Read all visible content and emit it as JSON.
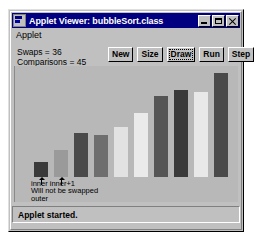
{
  "window": {
    "title": "Applet Viewer: bubbleSort.class",
    "icon": "applet-viewer-icon",
    "controls": {
      "minimize": "minimize-icon",
      "maximize": "maximize-icon",
      "close": "close-icon"
    }
  },
  "menubar": {
    "items": [
      "Applet"
    ]
  },
  "stats": {
    "swaps_label": "Swaps = 36",
    "comparisons_label": "Comparisons = 45",
    "swaps": 36,
    "comparisons": 45
  },
  "toolbar": {
    "buttons": [
      {
        "label": "New",
        "focused": false
      },
      {
        "label": "Size",
        "focused": false
      },
      {
        "label": "Draw",
        "focused": true
      },
      {
        "label": "Run",
        "focused": false
      },
      {
        "label": "Step",
        "focused": false
      }
    ]
  },
  "annotation": {
    "pointer_labels": "inner inner+1",
    "line2": "Will not be swapped",
    "line3": "outer",
    "markers": [
      {
        "name": "inner-marker",
        "index": 0
      },
      {
        "name": "inner-plus-one-marker",
        "index": 1
      }
    ]
  },
  "statusbar": {
    "text": "Applet started."
  },
  "colors": {
    "titlebar": "#000080",
    "face": "#c0c0c0",
    "panel": "#b8b8b8",
    "bar_dark": "#3a3a3a",
    "bar_medium": "#9a9a9a",
    "bar_light": "#e2e2e2"
  },
  "chart_data": {
    "type": "bar",
    "title": "",
    "xlabel": "",
    "ylabel": "",
    "grid": false,
    "legend": null,
    "ylim": [
      0,
      100
    ],
    "categories": [
      "0",
      "1",
      "2",
      "3",
      "4",
      "5",
      "6",
      "7",
      "8",
      "9"
    ],
    "values": [
      14,
      26,
      42,
      40,
      48,
      62,
      78,
      84,
      82,
      100
    ],
    "bar_colors": [
      "#3a3a3a",
      "#9a9a9a",
      "#4a4a4a",
      "#6e6e6e",
      "#e2e2e2",
      "#eaeaea",
      "#555555",
      "#3a3a3a",
      "#e8e8e8",
      "#4a4a4a"
    ]
  }
}
